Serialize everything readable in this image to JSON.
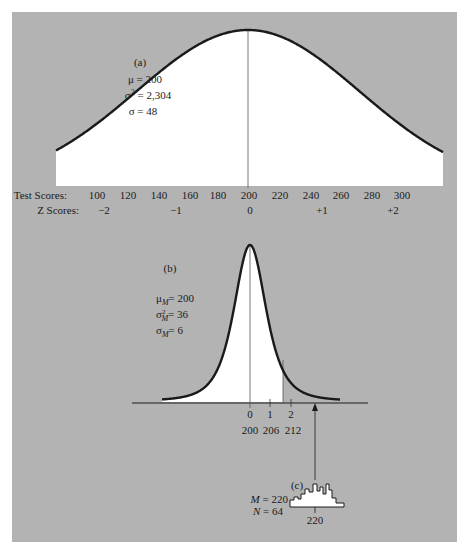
{
  "chart_data": [
    {
      "type": "area",
      "id": "a",
      "panel_label": "(a)",
      "title": "Distribution of test scores",
      "params": {
        "mu_label": "μ = 200",
        "var_label": "σ² = 2,304",
        "sd_label": "σ = 48",
        "mu": 200,
        "variance": 2304,
        "sd": 48
      },
      "axis_rows": [
        {
          "label": "Test Scores:",
          "ticks": [
            "100",
            "120",
            "140",
            "160",
            "180",
            "200",
            "220",
            "240",
            "260",
            "280",
            "300"
          ],
          "values": [
            100,
            120,
            140,
            160,
            180,
            200,
            220,
            240,
            260,
            280,
            300
          ]
        },
        {
          "label": "Z Scores:",
          "ticks": [
            "−2",
            "−1",
            "0",
            "+1",
            "+2"
          ],
          "values": [
            -2,
            -1,
            0,
            1,
            2
          ]
        }
      ],
      "mean_line": 200
    },
    {
      "type": "area",
      "id": "b",
      "panel_label": "(b)",
      "title": "Sampling distribution of the mean",
      "params": {
        "mu_label": "μM = 200",
        "var_label": "σ²M = 36",
        "sd_label": "σM = 6",
        "mu": 200,
        "variance": 36,
        "sd": 6
      },
      "axis_rows": [
        {
          "label": "",
          "ticks": [
            "0",
            "1",
            "2"
          ],
          "values": [
            0,
            1,
            2
          ]
        },
        {
          "label": "",
          "ticks": [
            "200",
            "206",
            "212"
          ],
          "values": [
            200,
            206,
            212
          ]
        }
      ],
      "mean_line": 200,
      "shaded_to": 211,
      "arrow_at": 220
    },
    {
      "type": "bar",
      "id": "c",
      "panel_label": "(c)",
      "title": "Sample histogram",
      "params": {
        "m_label": "M = 220",
        "n_label": "N = 64",
        "M": 220,
        "N": 64
      },
      "tick_label": "220"
    }
  ],
  "labels": {
    "a_panel": "(a)",
    "a_mu": "μ = 200",
    "a_sd": "σ = 48",
    "test_scores": "Test Scores:",
    "z_scores": "Z Scores:",
    "ts": [
      "100",
      "120",
      "140",
      "160",
      "180",
      "200",
      "220",
      "240",
      "260",
      "280",
      "300"
    ],
    "zs": [
      "−2",
      "−1",
      "0",
      "+1",
      "+2"
    ],
    "b_panel": "(b)",
    "b_mu": "= 200",
    "b_var": "= 36",
    "b_sd": "= 6",
    "b_z": [
      "0",
      "1",
      "2"
    ],
    "b_raw": [
      "200",
      "206",
      "212"
    ],
    "c_panel": "(c)",
    "c_m": "M = 220",
    "c_n": "N = 64",
    "c_tick": "220"
  }
}
